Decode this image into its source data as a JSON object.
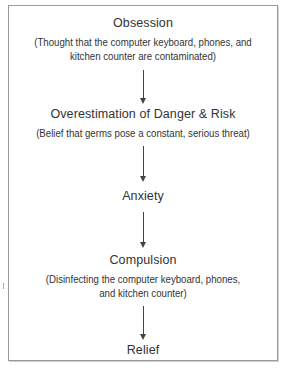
{
  "diagram": {
    "type": "flowchart",
    "direction": "top-to-bottom",
    "nodes": [
      {
        "id": "obsession",
        "title": "Obsession",
        "description": [
          "(Thought that the computer keyboard, phones, and",
          "kitchen counter are contaminated)"
        ]
      },
      {
        "id": "overestimation",
        "title": "Overestimation of Danger & Risk",
        "description": [
          "(Belief that germs pose a constant, serious threat)"
        ]
      },
      {
        "id": "anxiety",
        "title": "Anxiety",
        "description": []
      },
      {
        "id": "compulsion",
        "title": "Compulsion",
        "description": [
          "(Disinfecting the computer keyboard, phones,",
          "and kitchen counter)"
        ]
      },
      {
        "id": "relief",
        "title": "Relief",
        "description": []
      }
    ],
    "edges": [
      {
        "from": "obsession",
        "to": "overestimation"
      },
      {
        "from": "overestimation",
        "to": "anxiety"
      },
      {
        "from": "anxiety",
        "to": "compulsion"
      },
      {
        "from": "compulsion",
        "to": "relief"
      }
    ],
    "colors": {
      "border": "#9a9a9a",
      "text": "#333333",
      "arrow": "#444444"
    }
  }
}
